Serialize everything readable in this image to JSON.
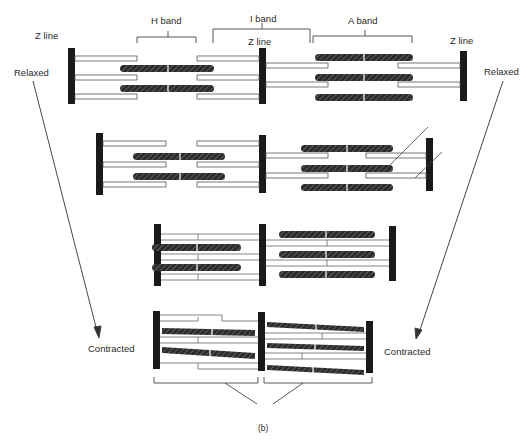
{
  "figure": {
    "caption": "(b)",
    "labels": {
      "z_line_left": "Z line",
      "z_line_mid": "Z line",
      "z_line_right": "Z line",
      "h_band": "H band",
      "i_band": "I band",
      "a_band": "A band",
      "relaxed_left": "Relaxed",
      "relaxed_right": "Relaxed",
      "contracted_left": "Contracted",
      "contracted_right": "Contracted"
    },
    "stages": [
      {
        "name": "relaxed",
        "order": 1
      },
      {
        "name": "partially-contracted",
        "order": 2
      },
      {
        "name": "further-contracted",
        "order": 3
      },
      {
        "name": "contracted",
        "order": 4
      }
    ],
    "colors": {
      "z_line": "#1a1a1a",
      "thick_filament": "#2b2b2b",
      "thin_filament_stroke": "#555555",
      "background": "#ffffff"
    }
  }
}
